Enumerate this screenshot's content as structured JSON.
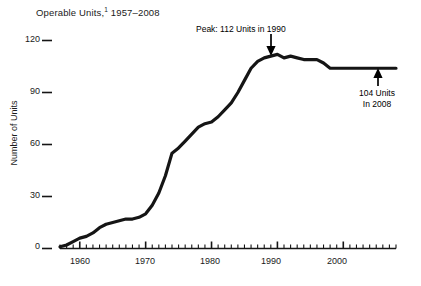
{
  "chart_data": {
    "type": "line",
    "title": "Operable Units,1 1957–2008",
    "title_main": "Operable Units,",
    "title_footnote_marker": "1",
    "title_range": " 1957–2008",
    "xlabel": "",
    "ylabel": "Number of Units",
    "xlim": [
      1957,
      2008
    ],
    "ylim": [
      0,
      120
    ],
    "y_ticks": [
      0,
      30,
      60,
      90,
      120
    ],
    "y_tick_labels": [
      "0",
      "30",
      "60",
      "90",
      "120"
    ],
    "x_ticks": [
      1960,
      1970,
      1980,
      1990,
      2000
    ],
    "x_tick_labels": [
      "1960",
      "1970",
      "1980",
      "1990",
      "2000"
    ],
    "x_minor_tick_interval": 1,
    "grid": false,
    "legend": null,
    "line_color": "#151515",
    "line_width": 3,
    "annotations": [
      {
        "name": "peak-annotation",
        "text": "Peak:  112 Units in 1990",
        "x": 1990,
        "y": 112,
        "arrow": "down"
      },
      {
        "name": "current-annotation",
        "text_line_1": "104 Units",
        "text_line_2": "In 2008",
        "x": 2008,
        "y": 104,
        "arrow": "up"
      }
    ],
    "x": [
      1957,
      1958,
      1959,
      1960,
      1961,
      1962,
      1963,
      1964,
      1965,
      1966,
      1967,
      1968,
      1969,
      1970,
      1971,
      1972,
      1973,
      1974,
      1975,
      1976,
      1977,
      1978,
      1979,
      1980,
      1981,
      1982,
      1983,
      1984,
      1985,
      1986,
      1987,
      1988,
      1989,
      1990,
      1991,
      1992,
      1993,
      1994,
      1995,
      1996,
      1997,
      1998,
      1999,
      2000,
      2001,
      2002,
      2003,
      2004,
      2005,
      2006,
      2007,
      2008
    ],
    "values": [
      1,
      2,
      4,
      6,
      7,
      9,
      12,
      14,
      15,
      16,
      17,
      17,
      18,
      20,
      25,
      32,
      42,
      55,
      58,
      62,
      66,
      70,
      72,
      73,
      76,
      80,
      84,
      90,
      97,
      104,
      108,
      110,
      111,
      112,
      110,
      111,
      110,
      109,
      109,
      109,
      107,
      104,
      104,
      104,
      104,
      104,
      104,
      104,
      104,
      104,
      104,
      104
    ]
  },
  "axes": {
    "y_axis_title": "Number of Units"
  }
}
